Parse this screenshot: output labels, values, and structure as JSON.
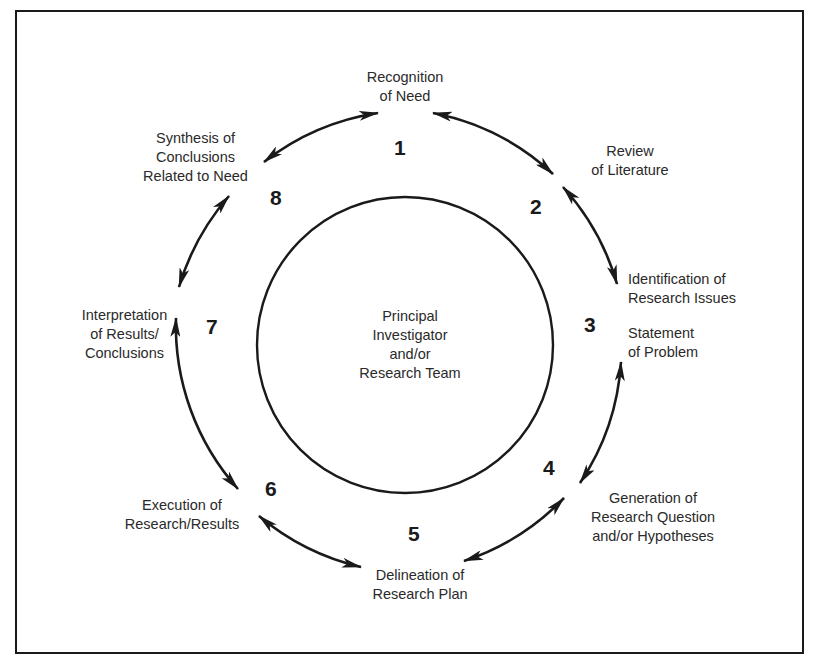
{
  "diagram": {
    "type": "cycle",
    "center": {
      "label": "Principal\nInvestigator\nand/or\nResearch Team"
    },
    "steps": [
      {
        "number": "1",
        "label": "Recognition\nof Need"
      },
      {
        "number": "2",
        "label": "Review\nof Literature"
      },
      {
        "number": "3",
        "label": "Identification of\nResearch Issues",
        "label_b": "Statement\nof Problem"
      },
      {
        "number": "4",
        "label": "Generation of\nResearch Question\nand/or Hypotheses"
      },
      {
        "number": "5",
        "label": "Delineation of\nResearch Plan"
      },
      {
        "number": "6",
        "label": "Execution of\nResearch/Results"
      },
      {
        "number": "7",
        "label": "Interpretation\nof Results/\nConclusions"
      },
      {
        "number": "8",
        "label": "Synthesis of\nConclusions\nRelated to Need"
      }
    ],
    "connections": [
      {
        "from": "1",
        "to": "8",
        "style": "double-arrow"
      },
      {
        "from": "1",
        "to": "2",
        "style": "double-arrow"
      },
      {
        "from": "2",
        "to": "3",
        "style": "double-arrow"
      },
      {
        "from": "3",
        "to": "4",
        "style": "double-arrow"
      },
      {
        "from": "4",
        "to": "5",
        "style": "double-arrow"
      },
      {
        "from": "5",
        "to": "6",
        "style": "double-arrow"
      },
      {
        "from": "6",
        "to": "7",
        "style": "double-arrow"
      },
      {
        "from": "7",
        "to": "8",
        "style": "double-arrow"
      }
    ],
    "colors": {
      "stroke": "#1a1a1a",
      "text": "#2a2a2a",
      "background": "#ffffff"
    }
  }
}
